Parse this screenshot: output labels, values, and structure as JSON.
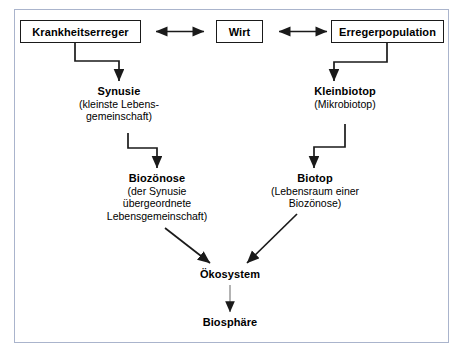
{
  "diagram": {
    "frame_border_color": "#aab4cc",
    "line_color": "#1a1a1a",
    "light_line_color": "#808080",
    "background_color": "#ffffff",
    "boxes": [
      {
        "id": "krankheitserreger",
        "label": "Krankheitserreger"
      },
      {
        "id": "wirt",
        "label": "Wirt"
      },
      {
        "id": "erregerpopulation",
        "label": "Erregerpopulation"
      }
    ],
    "text_nodes": [
      {
        "id": "synusie",
        "title": "Synusie",
        "sub_lines": [
          "(kleinste Lebens-",
          "gemeinschaft)"
        ]
      },
      {
        "id": "kleinbiotop",
        "title": "Kleinbiotop",
        "sub_lines": [
          "(Mikrobiotop)"
        ]
      },
      {
        "id": "biozoenose",
        "title": "Biozönose",
        "sub_lines": [
          "(der Synusie",
          "übergeordnete",
          "Lebensgemeinschaft)"
        ]
      },
      {
        "id": "biotop",
        "title": "Biotop",
        "sub_lines": [
          "(Lebensraum einer",
          "Biozönose)"
        ]
      },
      {
        "id": "oekosystem",
        "title": "Ökosystem",
        "sub_lines": []
      },
      {
        "id": "biosphaere",
        "title": "Biosphäre",
        "sub_lines": []
      }
    ],
    "connectors": [
      {
        "id": "krankheitserreger-wirt",
        "kind": "double-arrow-horizontal"
      },
      {
        "id": "wirt-erregerpopulation",
        "kind": "double-arrow-horizontal"
      },
      {
        "id": "krankheitserreger-synusie",
        "kind": "elbow-down-right-down"
      },
      {
        "id": "erregerpopulation-kleinbiotop",
        "kind": "elbow-down-left-down"
      },
      {
        "id": "synusie-biozoenose",
        "kind": "elbow-down-right-down"
      },
      {
        "id": "kleinbiotop-biotop",
        "kind": "elbow-down-left-down"
      },
      {
        "id": "biozoenose-oekosystem",
        "kind": "diagonal-arrow"
      },
      {
        "id": "biotop-oekosystem",
        "kind": "diagonal-arrow"
      },
      {
        "id": "oekosystem-biosphaere",
        "kind": "straight-arrow-down-light"
      }
    ]
  }
}
